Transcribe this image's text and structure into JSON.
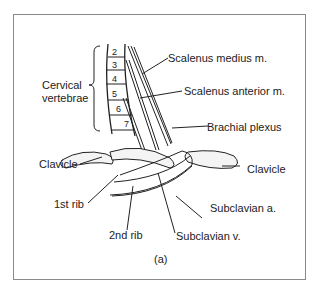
{
  "figure": {
    "caption": "(a)",
    "labels": {
      "cervical_vertebrae_line1": "Cervical",
      "cervical_vertebrae_line2": "vertebrae",
      "scalenus_medius": "Scalenus medius m.",
      "scalenus_anterior": "Scalenus anterior m.",
      "brachial_plexus": "Brachial plexus",
      "clavicle_left": "Clavicle",
      "clavicle_right": "Clavicle",
      "first_rib": "1st rib",
      "second_rib": "2nd rib",
      "subclavian_artery": "Subclavian a.",
      "subclavian_vein": "Subclavian v."
    },
    "vertebra_numbers": [
      "2",
      "3",
      "4",
      "5",
      "6",
      "7"
    ]
  }
}
